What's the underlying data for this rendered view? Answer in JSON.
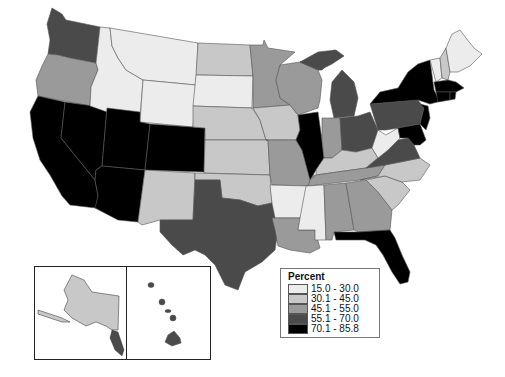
{
  "legend": {
    "title": "Percent",
    "classes": [
      {
        "label": "15.0 - 30.0",
        "color": "#ececec"
      },
      {
        "label": "30.1 - 45.0",
        "color": "#c8c8c8"
      },
      {
        "label": "45.1 - 55.0",
        "color": "#9a9a9a"
      },
      {
        "label": "55.1 - 70.0",
        "color": "#4a4a4a"
      },
      {
        "label": "70.1 - 85.8",
        "color": "#000000"
      }
    ]
  },
  "states": {
    "WA": "55.1 - 70.0",
    "OR": "45.1 - 55.0",
    "CA": "70.1 - 85.8",
    "NV": "70.1 - 85.8",
    "ID": "15.0 - 30.0",
    "MT": "15.0 - 30.0",
    "WY": "15.0 - 30.0",
    "UT": "70.1 - 85.8",
    "AZ": "70.1 - 85.8",
    "CO": "70.1 - 85.8",
    "NM": "30.1 - 45.0",
    "ND": "30.1 - 45.0",
    "SD": "15.0 - 30.0",
    "NE": "30.1 - 45.0",
    "KS": "30.1 - 45.0",
    "OK": "30.1 - 45.0",
    "TX": "55.1 - 70.0",
    "MN": "45.1 - 55.0",
    "IA": "30.1 - 45.0",
    "MO": "45.1 - 55.0",
    "AR": "15.0 - 30.0",
    "LA": "45.1 - 55.0",
    "WI": "45.1 - 55.0",
    "IL": "70.1 - 85.8",
    "MI": "55.1 - 70.0",
    "IN": "45.1 - 55.0",
    "OH": "55.1 - 70.0",
    "KY": "30.1 - 45.0",
    "TN": "45.1 - 55.0",
    "MS": "15.0 - 30.0",
    "AL": "45.1 - 55.0",
    "GA": "45.1 - 55.0",
    "FL": "70.1 - 85.8",
    "SC": "30.1 - 45.0",
    "NC": "30.1 - 45.0",
    "VA": "55.1 - 70.0",
    "WV": "15.0 - 30.0",
    "PA": "55.1 - 70.0",
    "NY": "70.1 - 85.8",
    "NJ": "70.1 - 85.8",
    "MD": "70.1 - 85.8",
    "DE": "55.1 - 70.0",
    "CT": "70.1 - 85.8",
    "RI": "70.1 - 85.8",
    "MA": "70.1 - 85.8",
    "VT": "15.0 - 30.0",
    "NH": "30.1 - 45.0",
    "ME": "15.0 - 30.0",
    "AK": "30.1 - 45.0",
    "HI": "55.1 - 70.0"
  }
}
